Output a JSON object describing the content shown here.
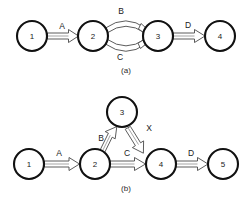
{
  "figure": {
    "background_color": "#ffffff",
    "line_color": "#4a4a4a",
    "node_stroke_color": "#111111",
    "text_color": "#1a1a1a",
    "subfigures": [
      {
        "id": "a",
        "caption": "(a)",
        "nodes": [
          {
            "label": "1",
            "cx": 32,
            "cy": 36,
            "r": 15
          },
          {
            "label": "2",
            "cx": 93,
            "cy": 36,
            "r": 15
          },
          {
            "label": "3",
            "cx": 158,
            "cy": 36,
            "r": 15
          },
          {
            "label": "4",
            "cx": 220,
            "cy": 36,
            "r": 15
          }
        ],
        "edges": [
          {
            "label": "A",
            "from": "1",
            "to": "2",
            "shape": "straight",
            "label_x": 62,
            "label_y": 26
          },
          {
            "label": "B",
            "from": "2",
            "to": "3",
            "shape": "curve-up",
            "label_x": 121,
            "label_y": 11
          },
          {
            "label": "C",
            "from": "2",
            "to": "3",
            "shape": "curve-down",
            "label_x": 120,
            "label_y": 57
          },
          {
            "label": "D",
            "from": "3",
            "to": "4",
            "shape": "straight",
            "label_x": 188,
            "label_y": 25
          }
        ]
      },
      {
        "id": "b",
        "caption": "(b)",
        "nodes": [
          {
            "label": "1",
            "cx": 29,
            "cy": 164,
            "r": 15
          },
          {
            "label": "2",
            "cx": 95,
            "cy": 164,
            "r": 15
          },
          {
            "label": "3",
            "cx": 122,
            "cy": 112,
            "r": 15
          },
          {
            "label": "4",
            "cx": 161,
            "cy": 164,
            "r": 15
          },
          {
            "label": "5",
            "cx": 223,
            "cy": 164,
            "r": 15
          }
        ],
        "edges": [
          {
            "label": "A",
            "from": "1",
            "to": "2",
            "shape": "straight",
            "label_x": 59,
            "label_y": 153
          },
          {
            "label": "B",
            "from": "2",
            "to": "3",
            "shape": "straight",
            "label_x": 101,
            "label_y": 138
          },
          {
            "label": "X",
            "from": "3",
            "to": "4",
            "shape": "straight",
            "label_x": 149,
            "label_y": 128
          },
          {
            "label": "C",
            "from": "2",
            "to": "4",
            "shape": "straight",
            "label_x": 127,
            "label_y": 153
          },
          {
            "label": "D",
            "from": "4",
            "to": "5",
            "shape": "straight",
            "label_x": 191,
            "label_y": 153
          }
        ]
      }
    ]
  }
}
